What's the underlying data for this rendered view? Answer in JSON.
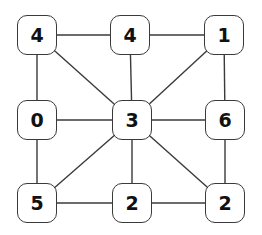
{
  "diagram": {
    "type": "graph",
    "nodes": [
      {
        "id": "n00",
        "label": "4",
        "x": 37,
        "y": 35
      },
      {
        "id": "n01",
        "label": "4",
        "x": 130,
        "y": 35
      },
      {
        "id": "n02",
        "label": "1",
        "x": 224,
        "y": 35
      },
      {
        "id": "n10",
        "label": "0",
        "x": 37,
        "y": 120
      },
      {
        "id": "n11",
        "label": "3",
        "x": 132,
        "y": 120
      },
      {
        "id": "n12",
        "label": "6",
        "x": 225,
        "y": 120
      },
      {
        "id": "n20",
        "label": "5",
        "x": 37,
        "y": 203
      },
      {
        "id": "n21",
        "label": "2",
        "x": 132,
        "y": 203
      },
      {
        "id": "n22",
        "label": "2",
        "x": 225,
        "y": 203
      }
    ],
    "edges": [
      [
        "n00",
        "n01"
      ],
      [
        "n01",
        "n02"
      ],
      [
        "n00",
        "n10"
      ],
      [
        "n00",
        "n11"
      ],
      [
        "n01",
        "n11"
      ],
      [
        "n02",
        "n11"
      ],
      [
        "n02",
        "n12"
      ],
      [
        "n10",
        "n11"
      ],
      [
        "n11",
        "n12"
      ],
      [
        "n10",
        "n20"
      ],
      [
        "n11",
        "n20"
      ],
      [
        "n11",
        "n21"
      ],
      [
        "n11",
        "n22"
      ],
      [
        "n12",
        "n22"
      ],
      [
        "n20",
        "n21"
      ],
      [
        "n21",
        "n22"
      ]
    ],
    "colors": {
      "stroke": "#3a3a3a",
      "fill": "#ffffff",
      "text": "#111111"
    }
  }
}
